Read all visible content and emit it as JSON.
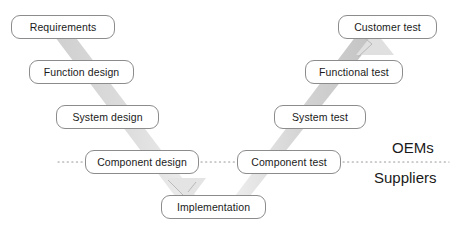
{
  "diagram": {
    "type": "v-model",
    "canvas": {
      "width": 451,
      "height": 231
    },
    "colors": {
      "background": "#ffffff",
      "box_border": "#8c8c8c",
      "box_fill": "#ffffff",
      "text": "#1a1a1a",
      "band_left": "#d8d8d8",
      "band_right": "#c9c9c9",
      "dotted_line": "#9a9a9a"
    },
    "left_branch": {
      "name": "design-and-specification",
      "nodes": [
        {
          "id": "requirements",
          "label": "Requirements",
          "x": 11,
          "y": 15,
          "w": 104,
          "h": 24
        },
        {
          "id": "function-design",
          "label": "Function design",
          "x": 29,
          "y": 60,
          "w": 105,
          "h": 24
        },
        {
          "id": "system-design",
          "label": "System design",
          "x": 56,
          "y": 105,
          "w": 103,
          "h": 24
        },
        {
          "id": "component-design",
          "label": "Component design",
          "x": 85,
          "y": 150,
          "w": 114,
          "h": 24
        }
      ]
    },
    "bottom": {
      "nodes": [
        {
          "id": "implementation",
          "label": "Implementation",
          "x": 161,
          "y": 195,
          "w": 105,
          "h": 24
        }
      ]
    },
    "right_branch": {
      "name": "verification-and-validation",
      "nodes": [
        {
          "id": "component-test",
          "label": "Component test",
          "x": 237,
          "y": 150,
          "w": 104,
          "h": 24
        },
        {
          "id": "system-test",
          "label": "System test",
          "x": 274,
          "y": 105,
          "w": 92,
          "h": 24
        },
        {
          "id": "functional-test",
          "label": "Functional test",
          "x": 305,
          "y": 60,
          "w": 98,
          "h": 24
        },
        {
          "id": "customer-test",
          "label": "Customer test",
          "x": 338,
          "y": 15,
          "w": 99,
          "h": 24
        }
      ]
    },
    "responsibility_labels": [
      {
        "id": "oems",
        "label": "OEMs",
        "x": 392,
        "y": 140
      },
      {
        "id": "suppliers",
        "label": "Suppliers",
        "x": 374,
        "y": 170
      }
    ],
    "divider": {
      "name": "oem-supplier-divider",
      "style": "dotted",
      "y": 162,
      "segments": [
        {
          "x1": 58,
          "x2": 84
        },
        {
          "x1": 200,
          "x2": 236
        },
        {
          "x1": 342,
          "x2": 449
        }
      ]
    },
    "connectors": [
      {
        "id": "requirements-to-function-design",
        "from": "requirements",
        "to": "function-design",
        "style": "band"
      },
      {
        "id": "function-design-to-system-design",
        "from": "function-design",
        "to": "system-design",
        "style": "band"
      },
      {
        "id": "system-design-to-component-design",
        "from": "system-design",
        "to": "component-design",
        "style": "band"
      },
      {
        "id": "component-design-to-implementation",
        "from": "component-design",
        "to": "implementation",
        "style": "band-arrow"
      },
      {
        "id": "implementation-to-component-test",
        "from": "implementation",
        "to": "component-test",
        "style": "band"
      },
      {
        "id": "component-test-to-system-test",
        "from": "component-test",
        "to": "system-test",
        "style": "band"
      },
      {
        "id": "system-test-to-functional-test",
        "from": "system-test",
        "to": "functional-test",
        "style": "band"
      },
      {
        "id": "functional-test-to-customer-test",
        "from": "functional-test",
        "to": "customer-test",
        "style": "band-arrow"
      }
    ]
  }
}
